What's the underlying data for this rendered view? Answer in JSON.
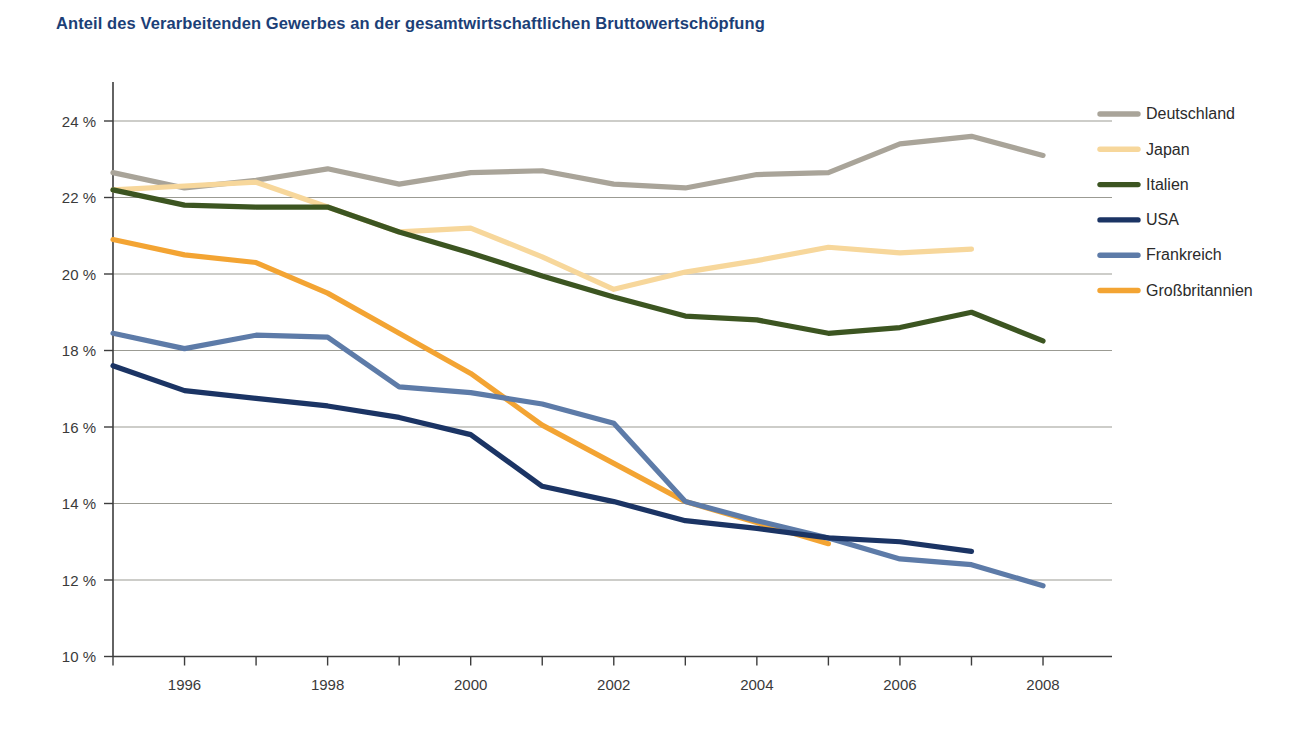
{
  "chart_data": {
    "type": "line",
    "title": "Anteil des Verarbeitenden Gewerbes an der gesamtwirtschaftlichen Bruttowertschöpfung",
    "xlabel": "",
    "ylabel": "",
    "x": [
      1995,
      1996,
      1997,
      1998,
      1999,
      2000,
      2001,
      2002,
      2003,
      2004,
      2005,
      2006,
      2007,
      2008
    ],
    "xlim": [
      1995,
      2008
    ],
    "ylim": [
      10,
      24
    ],
    "ytick_values": [
      10,
      12,
      14,
      16,
      18,
      20,
      22,
      24
    ],
    "ytick_labels": [
      "10 %",
      "12 %",
      "14 %",
      "16 %",
      "18 %",
      "20 %",
      "22 %",
      "24 %"
    ],
    "xtick_values": [
      1996,
      1998,
      2000,
      2002,
      2004,
      2006,
      2008
    ],
    "xtick_labels": [
      "1996",
      "1998",
      "2000",
      "2002",
      "2004",
      "2006",
      "2008"
    ],
    "xtick_minor_values": [
      1995,
      1997,
      1999,
      2001,
      2003,
      2005,
      2007
    ],
    "grid": "horizontal",
    "legend_position": "right",
    "y_unit": "%",
    "series": [
      {
        "name": "Deutschland",
        "color": "#a9a499",
        "x": [
          1995,
          1996,
          1997,
          1998,
          1999,
          2000,
          2001,
          2002,
          2003,
          2004,
          2005,
          2006,
          2007,
          2008
        ],
        "values": [
          22.65,
          22.25,
          22.45,
          22.75,
          22.35,
          22.65,
          22.7,
          22.35,
          22.25,
          22.6,
          22.65,
          23.4,
          23.6,
          23.1
        ]
      },
      {
        "name": "Japan",
        "color": "#f7d79b",
        "x": [
          1995,
          1996,
          1997,
          1998,
          1999,
          2000,
          2001,
          2002,
          2003,
          2004,
          2005,
          2006,
          2007
        ],
        "values": [
          22.2,
          22.3,
          22.4,
          21.75,
          21.1,
          21.2,
          20.45,
          19.6,
          20.05,
          20.35,
          20.7,
          20.55,
          20.65
        ]
      },
      {
        "name": "Italien",
        "color": "#3c5521",
        "x": [
          1995,
          1996,
          1997,
          1998,
          1999,
          2000,
          2001,
          2002,
          2003,
          2004,
          2005,
          2006,
          2007,
          2008
        ],
        "values": [
          22.2,
          21.8,
          21.75,
          21.75,
          21.1,
          20.55,
          19.95,
          19.4,
          18.9,
          18.8,
          18.45,
          18.6,
          19.0,
          18.25
        ]
      },
      {
        "name": "USA",
        "color": "#1b3464",
        "x": [
          1995,
          1996,
          1997,
          1998,
          1999,
          2000,
          2001,
          2002,
          2003,
          2004,
          2005,
          2006,
          2007
        ],
        "values": [
          17.6,
          16.95,
          16.75,
          16.55,
          16.25,
          15.8,
          14.45,
          14.05,
          13.55,
          13.35,
          13.1,
          13.0,
          12.75
        ]
      },
      {
        "name": "Frankreich",
        "color": "#5d7ba8",
        "x": [
          1995,
          1996,
          1997,
          1998,
          1999,
          2000,
          2001,
          2002,
          2003,
          2004,
          2005,
          2006,
          2007,
          2008
        ],
        "values": [
          18.45,
          18.05,
          18.4,
          18.35,
          17.05,
          16.9,
          16.6,
          16.1,
          14.05,
          13.55,
          13.1,
          12.55,
          12.4,
          11.85
        ]
      },
      {
        "name": "Großbritannien",
        "color": "#f3a433",
        "x": [
          1995,
          1996,
          1997,
          1998,
          1999,
          2000,
          2001,
          2002,
          2003,
          2004,
          2005
        ],
        "values": [
          20.9,
          20.5,
          20.3,
          19.5,
          18.45,
          17.4,
          16.05,
          15.05,
          14.05,
          13.5,
          12.95
        ]
      }
    ]
  }
}
